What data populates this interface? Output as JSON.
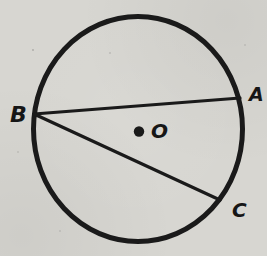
{
  "diagram": {
    "type": "geometry-circle-with-chords",
    "background_color": "#d7d6d1",
    "ink_color": "#1a1a1a",
    "circle": {
      "cx": 138,
      "cy": 129,
      "rx": 104.5,
      "ry": 112.5,
      "stroke_width": 5
    },
    "center": {
      "label": "O",
      "dot_x": 139,
      "dot_y": 131.5,
      "dot_r": 5.2,
      "label_x": 151,
      "label_y": 138
    },
    "points": [
      {
        "label": "B",
        "x": 34,
        "y": 114,
        "label_x": 10,
        "label_y": 122
      },
      {
        "label": "A",
        "x": 240,
        "y": 98,
        "label_x": 249,
        "label_y": 101
      },
      {
        "label": "C",
        "x": 220,
        "y": 200,
        "label_x": 232,
        "label_y": 217
      }
    ],
    "chords": [
      {
        "from": "B",
        "to": "A"
      },
      {
        "from": "B",
        "to": "C"
      }
    ],
    "chord_stroke_width": 3.2
  }
}
